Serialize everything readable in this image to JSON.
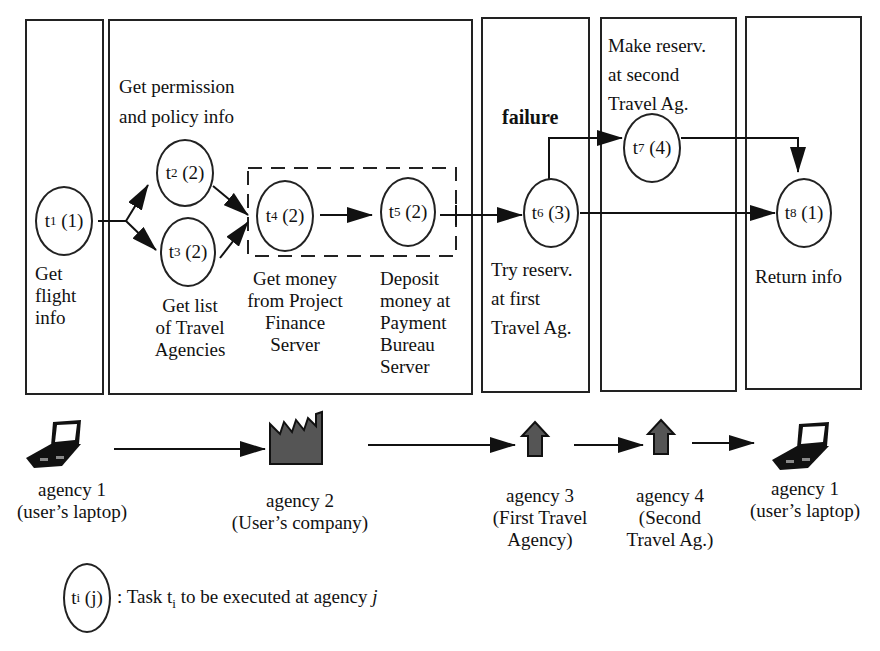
{
  "colors": {
    "ink": "#222222",
    "icon_fill": "#555555",
    "background": "#ffffff"
  },
  "tasks": [
    {
      "id": "t1",
      "sub": "1",
      "agency": "(1)",
      "label": "Get flight info"
    },
    {
      "id": "t2",
      "sub": "2",
      "agency": "(2)",
      "label": "Get permission and policy info"
    },
    {
      "id": "t3",
      "sub": "3",
      "agency": "(2)",
      "label": "Get list of Travel Agencies"
    },
    {
      "id": "t4",
      "sub": "4",
      "agency": "(2)",
      "label": "Get money from Project Finance Server"
    },
    {
      "id": "t5",
      "sub": "5",
      "agency": "(2)",
      "label": "Deposit money at Payment Bureau Server"
    },
    {
      "id": "t6",
      "sub": "6",
      "agency": "(3)",
      "label": "Try reserv. at first Travel Ag."
    },
    {
      "id": "t7",
      "sub": "7",
      "agency": "(4)",
      "label": "Make reserv. at second Travel Ag."
    },
    {
      "id": "t8",
      "sub": "8",
      "agency": "(1)",
      "label": "Return info"
    }
  ],
  "labels": {
    "t1": [
      "Get",
      "flight",
      "info"
    ],
    "t2": [
      "Get permission",
      "and policy info"
    ],
    "t3": [
      "Get list",
      "of Travel",
      "Agencies"
    ],
    "t4": [
      "Get money",
      "from Project",
      "Finance",
      "Server"
    ],
    "t5": [
      "Deposit",
      "money at",
      "Payment",
      "Bureau",
      "Server"
    ],
    "t6": [
      "Try reserv.",
      "at first",
      "Travel Ag."
    ],
    "t7": [
      "Make reserv.",
      "at second",
      "Travel Ag."
    ],
    "t8": [
      "Return info"
    ],
    "failure": "failure"
  },
  "agencies": [
    {
      "icon": "laptop-icon",
      "name": "agency 1",
      "desc": [
        "(user’s laptop)"
      ]
    },
    {
      "icon": "factory-icon",
      "name": "agency 2",
      "desc": [
        "(User’s company)"
      ]
    },
    {
      "icon": "house-icon",
      "name": "agency 3",
      "desc": [
        "(First Travel",
        "Agency)"
      ]
    },
    {
      "icon": "house-icon",
      "name": "agency 4",
      "desc": [
        "(Second",
        "Travel Ag.)"
      ]
    },
    {
      "icon": "laptop-icon",
      "name": "agency 1",
      "desc": [
        "(user’s laptop)"
      ]
    }
  ],
  "legend": {
    "node_t": "t",
    "node_sub": "i",
    "node_arg": "(j)",
    "text_prefix": ": Task t",
    "text_sub": "i",
    "text_mid": " to be executed at agency ",
    "text_var": "j"
  }
}
